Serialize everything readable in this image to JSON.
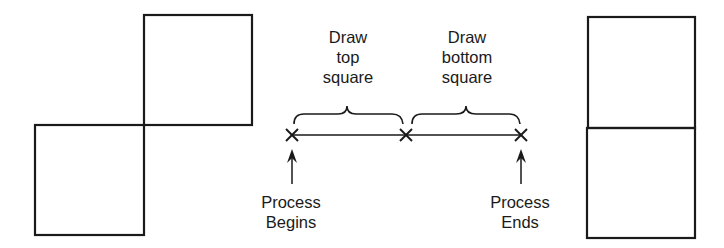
{
  "diagram": {
    "left_figure": {
      "description": "two squares offset diagonally (top-right and bottom-left)"
    },
    "right_figure": {
      "description": "two squares stacked vertically"
    },
    "timeline": {
      "points": [
        "start",
        "middle",
        "end"
      ],
      "segments": [
        {
          "label": "Draw\ntop\nsquare"
        },
        {
          "label": "Draw\nbottom\nsquare"
        }
      ],
      "start_label": "Process\nBegins",
      "end_label": "Process\nEnds"
    },
    "colors": {
      "stroke": "#1a1a1a",
      "background": "#ffffff"
    }
  }
}
